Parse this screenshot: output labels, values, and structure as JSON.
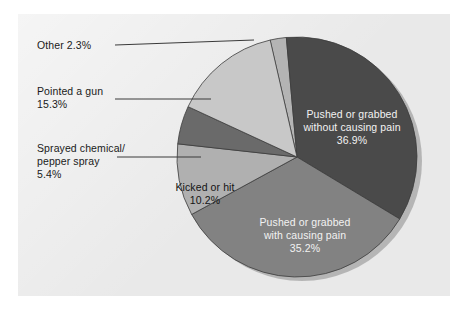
{
  "figure": {
    "background": "#ffffff",
    "panel_color": "#e9e9e9",
    "panel": {
      "x": 18,
      "y": 14,
      "w": 432,
      "h": 282
    }
  },
  "chart_data": {
    "type": "pie",
    "title": "",
    "subtitle": "",
    "xlabel": "",
    "ylabel": "",
    "legend_position": "none",
    "grid": false,
    "note": "Multiple-response survey; percentages sum to 105.3%. Slice sweep angles are drawn proportional to each value normalized over the 105.3% total.",
    "total_percent": 105.3,
    "start_angle_deg": -103,
    "direction": "clockwise",
    "center": {
      "x": 297,
      "y": 157
    },
    "radius": 120,
    "categories": [
      "Other",
      "Pushed or grabbed without causing pain",
      "Pushed or grabbed with causing pain",
      "Kicked or hit",
      "Sprayed chemical/pepper spray",
      "Pointed a gun"
    ],
    "values": [
      2.3,
      36.9,
      35.2,
      10.2,
      5.4,
      15.3
    ],
    "value_labels": [
      "2.3%",
      "36.9%",
      "35.2%",
      "10.2%",
      "5.4%",
      "15.3%"
    ],
    "colors": [
      "#b4b4b4",
      "#4a4a4a",
      "#828282",
      "#b0b0b0",
      "#6a6a6a",
      "#c8c8c8"
    ],
    "slices": [
      {
        "name": "Other",
        "value": 2.3,
        "label": "Other 2.3%",
        "color": "#b4b4b4",
        "start_deg": -103.0,
        "sweep_deg": 7.9,
        "label_placement": "outside-left",
        "label_color": "#1a1a1a"
      },
      {
        "name": "Pushed or grabbed without causing pain",
        "value": 36.9,
        "label": "Pushed or grabbed\nwithout causing pain\n36.9%",
        "color": "#4a4a4a",
        "start_deg": -95.1,
        "sweep_deg": 126.2,
        "label_placement": "inside",
        "label_color": "#f2f2f2"
      },
      {
        "name": "Pushed or grabbed with causing pain",
        "value": 35.2,
        "label": "Pushed or grabbed\nwith causing pain\n35.2%",
        "color": "#828282",
        "start_deg": 31.1,
        "sweep_deg": 120.3,
        "label_placement": "inside",
        "label_color": "#f2f2f2"
      },
      {
        "name": "Kicked or hit",
        "value": 10.2,
        "label": "Kicked or hit\n10.2%",
        "color": "#b0b0b0",
        "start_deg": 151.4,
        "sweep_deg": 34.9,
        "label_placement": "inside",
        "label_color": "#141414"
      },
      {
        "name": "Sprayed chemical/pepper spray",
        "value": 5.4,
        "label": "Sprayed chemical/\npepper spray\n5.4%",
        "color": "#6a6a6a",
        "start_deg": 186.3,
        "sweep_deg": 18.5,
        "label_placement": "outside-left",
        "label_color": "#1a1a1a"
      },
      {
        "name": "Pointed a gun",
        "value": 15.3,
        "label": "Pointed a gun\n15.3%",
        "color": "#c8c8c8",
        "start_deg": 204.8,
        "sweep_deg": 52.3,
        "label_placement": "outside-left",
        "label_color": "#1a1a1a"
      }
    ],
    "leader_lines": [
      {
        "for": "Other",
        "x1": 115,
        "y1": 45,
        "x2": 254,
        "y2": 40
      },
      {
        "for": "Pointed a gun",
        "x1": 115,
        "y1": 99,
        "x2": 211,
        "y2": 99
      },
      {
        "for": "Sprayed chemical/pepper spray",
        "x1": 117,
        "y1": 157,
        "x2": 201,
        "y2": 157
      }
    ]
  },
  "labels": {
    "other": "Other 2.3%",
    "pointed_gun": "Pointed a gun\n15.3%",
    "sprayed": "Sprayed chemical/\npepper spray\n5.4%",
    "kicked": "Kicked or hit\n10.2%",
    "pushed_no_pain": "Pushed or grabbed\nwithout causing pain\n36.9%",
    "pushed_pain": "Pushed or grabbed\nwith causing pain\n35.2%"
  }
}
